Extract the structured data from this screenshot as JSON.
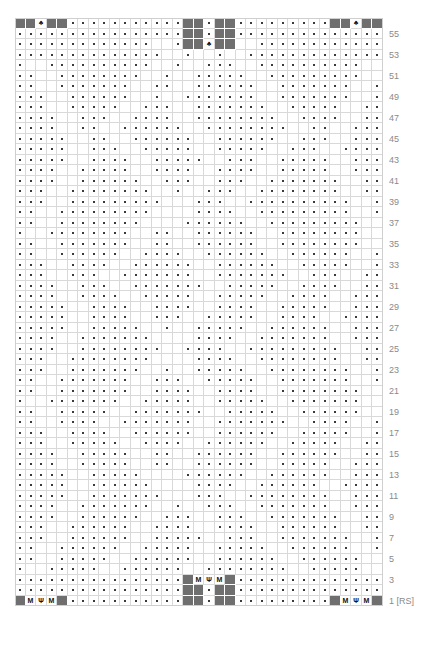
{
  "chart": {
    "type": "knitting-chart",
    "columns": 35,
    "rows": 56,
    "cell_size": 10.5,
    "origin": {
      "x": 15,
      "y": 18
    },
    "colors": {
      "background": "#ffffff",
      "grid_line": "#d9d9d9",
      "grid_line_major": "#9a9a9a",
      "dark_block": "#6f6f6f",
      "symbol": "#3a3a3a",
      "cable_stroke": "#3f3f3f",
      "row_number": "#8a8a8a"
    },
    "symbols": {
      "purl": "·",
      "make_one": "M",
      "central_decrease": "Ψ",
      "leaf": "♣",
      "knit_dark": ""
    },
    "row_numbers": [
      {
        "row": 55,
        "label": "55"
      },
      {
        "row": 53,
        "label": "53"
      },
      {
        "row": 51,
        "label": "51"
      },
      {
        "row": 49,
        "label": "49"
      },
      {
        "row": 47,
        "label": "47"
      },
      {
        "row": 45,
        "label": "45"
      },
      {
        "row": 43,
        "label": "43"
      },
      {
        "row": 41,
        "label": "41"
      },
      {
        "row": 39,
        "label": "39"
      },
      {
        "row": 37,
        "label": "37"
      },
      {
        "row": 35,
        "label": "35"
      },
      {
        "row": 33,
        "label": "33"
      },
      {
        "row": 31,
        "label": "31"
      },
      {
        "row": 29,
        "label": "29"
      },
      {
        "row": 27,
        "label": "27"
      },
      {
        "row": 25,
        "label": "25"
      },
      {
        "row": 23,
        "label": "23"
      },
      {
        "row": 21,
        "label": "21"
      },
      {
        "row": 19,
        "label": "19"
      },
      {
        "row": 17,
        "label": "17"
      },
      {
        "row": 15,
        "label": "15"
      },
      {
        "row": 13,
        "label": "13"
      },
      {
        "row": 11,
        "label": "11"
      },
      {
        "row": 9,
        "label": "9"
      },
      {
        "row": 7,
        "label": "7"
      },
      {
        "row": 5,
        "label": "5"
      },
      {
        "row": 3,
        "label": "3"
      },
      {
        "row": 1,
        "label": "1 [RS]"
      }
    ],
    "dark_blocks": [
      {
        "row": 56,
        "cols": [
          0,
          1
        ]
      },
      {
        "row": 56,
        "cols": [
          3,
          4
        ]
      },
      {
        "row": 56,
        "cols": [
          16,
          17
        ]
      },
      {
        "row": 56,
        "cols": [
          19,
          20
        ]
      },
      {
        "row": 56,
        "cols": [
          30,
          31
        ]
      },
      {
        "row": 56,
        "cols": [
          33,
          34
        ]
      },
      {
        "row": 55,
        "cols": [
          16,
          17
        ]
      },
      {
        "row": 55,
        "cols": [
          19,
          20
        ]
      },
      {
        "row": 54,
        "cols": [
          16,
          17
        ]
      },
      {
        "row": 54,
        "cols": [
          19,
          20
        ]
      },
      {
        "row": 3,
        "cols": [
          16,
          20
        ]
      },
      {
        "row": 2,
        "cols": [
          16,
          17
        ]
      },
      {
        "row": 2,
        "cols": [
          19,
          20
        ]
      },
      {
        "row": 1,
        "cols": [
          0
        ]
      },
      {
        "row": 1,
        "cols": [
          4
        ]
      },
      {
        "row": 1,
        "cols": [
          16,
          17
        ]
      },
      {
        "row": 1,
        "cols": [
          19,
          20
        ]
      },
      {
        "row": 1,
        "cols": [
          30
        ]
      },
      {
        "row": 1,
        "cols": [
          34
        ]
      }
    ],
    "letter_cells": [
      {
        "row": 1,
        "col": 1,
        "glyph": "M"
      },
      {
        "row": 1,
        "col": 2,
        "glyph": "Ψ"
      },
      {
        "row": 1,
        "col": 3,
        "glyph": "M"
      },
      {
        "row": 1,
        "col": 31,
        "glyph": "M"
      },
      {
        "row": 1,
        "col": 32,
        "glyph": "Ψ"
      },
      {
        "row": 1,
        "col": 33,
        "glyph": "M"
      },
      {
        "row": 3,
        "col": 17,
        "glyph": "M"
      },
      {
        "row": 3,
        "col": 18,
        "glyph": "Ψ"
      },
      {
        "row": 3,
        "col": 19,
        "glyph": "M"
      },
      {
        "row": 56,
        "col": 2,
        "glyph": "♣"
      },
      {
        "row": 56,
        "col": 32,
        "glyph": "♣"
      },
      {
        "row": 54,
        "col": 18,
        "glyph": "♣"
      }
    ]
  }
}
